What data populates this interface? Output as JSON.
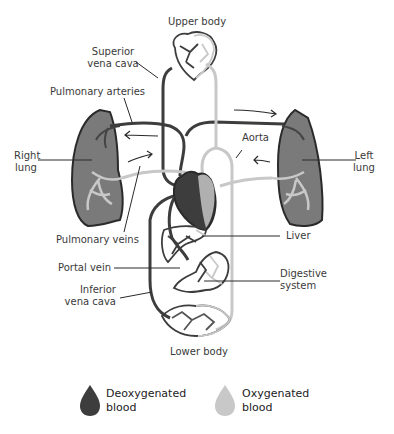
{
  "diagram": {
    "labels": {
      "upper_body": "Upper body",
      "superior_vena_cava": [
        "Superior",
        "vena cava"
      ],
      "pulmonary_arteries": "Pulmonary arteries",
      "right_lung": [
        "Right",
        "lung"
      ],
      "left_lung": [
        "Left",
        "lung"
      ],
      "aorta": "Aorta",
      "pulmonary_veins": "Pulmonary veins",
      "liver": "Liver",
      "portal_vein": "Portal vein",
      "digestive_system": [
        "Digestive",
        "system"
      ],
      "inferior_vena_cava": [
        "Inferior",
        "vena cava"
      ],
      "lower_body": "Lower body"
    },
    "legend": [
      {
        "label_line1": "Deoxygenated",
        "label_line2": "blood",
        "color": "#3d3d3d",
        "icon": "blood-drop-icon"
      },
      {
        "label_line1": "Oxygenated",
        "label_line2": "blood",
        "color": "#c8c8c8",
        "icon": "blood-drop-icon"
      }
    ],
    "colors": {
      "deoxygenated": "#3d3d3d",
      "oxygenated": "#c8c8c8",
      "lung_fill": "#7a7a7a",
      "outline": "#2a2a2a"
    }
  }
}
